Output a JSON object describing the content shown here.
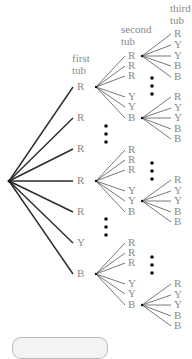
{
  "headers": {
    "first": [
      "first",
      "tub"
    ],
    "second": [
      "second",
      "tub"
    ],
    "third": [
      "third",
      "tub"
    ]
  },
  "root": {
    "x": 9,
    "y": 181
  },
  "first_tub": {
    "label_x": 77,
    "nodes": [
      {
        "label": "R",
        "y": 87
      },
      {
        "label": "R",
        "y": 118
      },
      {
        "label": "R",
        "y": 149
      },
      {
        "label": "R",
        "y": 181
      },
      {
        "label": "R",
        "y": 212
      },
      {
        "label": "Y",
        "y": 243
      },
      {
        "label": "B",
        "y": 274
      }
    ]
  },
  "second_tub_groups": [
    {
      "parent_index": 0,
      "origin": {
        "x": 96,
        "y": 87
      },
      "labels": [
        "R",
        "R",
        "R",
        "Y",
        "Y",
        "B"
      ],
      "ys": [
        56,
        66,
        76,
        97,
        107,
        118
      ]
    },
    {
      "parent_index": 3,
      "origin": {
        "x": 96,
        "y": 181
      },
      "labels": [
        "R",
        "R",
        "R",
        "Y",
        "Y",
        "B"
      ],
      "ys": [
        150,
        160,
        170,
        191,
        201,
        212
      ]
    },
    {
      "parent_index": 6,
      "origin": {
        "x": 96,
        "y": 274
      },
      "labels": [
        "R",
        "R",
        "R",
        "Y",
        "Y",
        "B"
      ],
      "ys": [
        243,
        253,
        263,
        284,
        294,
        305
      ]
    }
  ],
  "second_label_x": 128,
  "third_tub_groups": [
    {
      "origin": {
        "x": 142,
        "y": 56
      },
      "labels": [
        "R",
        "Y",
        "Y",
        "B",
        "B"
      ],
      "ys": [
        34,
        45,
        56,
        66,
        77
      ]
    },
    {
      "origin": {
        "x": 142,
        "y": 118
      },
      "labels": [
        "R",
        "Y",
        "Y",
        "B",
        "B"
      ],
      "ys": [
        97,
        108,
        118,
        129,
        139
      ]
    },
    {
      "origin": {
        "x": 142,
        "y": 201
      },
      "labels": [
        "R",
        "Y",
        "Y",
        "B",
        "B"
      ],
      "ys": [
        180,
        191,
        201,
        212,
        222
      ]
    },
    {
      "origin": {
        "x": 142,
        "y": 305
      },
      "labels": [
        "R",
        "Y",
        "Y",
        "B",
        "B"
      ],
      "ys": [
        284,
        295,
        305,
        316,
        326
      ]
    }
  ],
  "third_label_x": 174,
  "ellipses": [
    {
      "x": 106,
      "y": 134
    },
    {
      "x": 106,
      "y": 227
    },
    {
      "x": 152,
      "y": 86
    },
    {
      "x": 152,
      "y": 171
    },
    {
      "x": 152,
      "y": 265
    }
  ],
  "colors": {
    "root_branch": "#2a2a2a",
    "sub_branch": "#555555",
    "label": "#8a8a8a",
    "dot": "#111111"
  }
}
